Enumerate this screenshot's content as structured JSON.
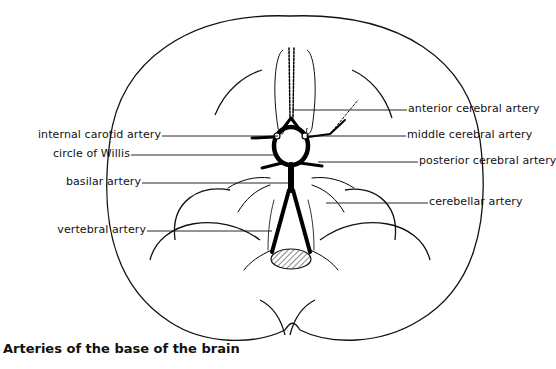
{
  "figure": {
    "caption": "Arteries of the base of the brain",
    "labels_left": [
      {
        "id": "internal-carotid-artery",
        "text": "internal carotid artery"
      },
      {
        "id": "circle-of-willis",
        "text": "circle of Willis"
      },
      {
        "id": "basilar-artery",
        "text": "basilar artery"
      },
      {
        "id": "vertebral-artery",
        "text": "vertebral artery"
      }
    ],
    "labels_right": [
      {
        "id": "anterior-cerebral-artery",
        "text": "anterior cerebral artery"
      },
      {
        "id": "middle-cerebral-artery",
        "text": "middle cerebral artery"
      },
      {
        "id": "posterior-cerebral-artery",
        "text": "posterior cerebral artery"
      },
      {
        "id": "cerebellar-artery",
        "text": "cerebellar artery"
      }
    ]
  }
}
